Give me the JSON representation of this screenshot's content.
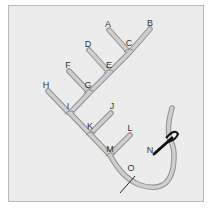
{
  "diagram": {
    "colors": {
      "background": "#ececec",
      "frame_border": "#b8b8b8",
      "tube_fill": "#cfcfcf",
      "tube_outline": "#8f8f8f",
      "needle": "#111111",
      "label": "#333333"
    },
    "labels": [
      {
        "id": "A",
        "text": "A",
        "x": 108,
        "y": 27
      },
      {
        "id": "B",
        "text": "B",
        "x": 150,
        "y": 26
      },
      {
        "id": "C",
        "text": "C",
        "x": 129,
        "y": 46
      },
      {
        "id": "D",
        "text": "D",
        "x": 88,
        "y": 47
      },
      {
        "id": "E",
        "text": "E",
        "x": 109,
        "y": 68
      },
      {
        "id": "F",
        "text": "F",
        "x": 68,
        "y": 68
      },
      {
        "id": "G",
        "text": "G",
        "x": 88,
        "y": 88
      },
      {
        "id": "H",
        "text": "H",
        "x": 46,
        "y": 88
      },
      {
        "id": "I",
        "text": "I",
        "x": 68,
        "y": 109
      },
      {
        "id": "J",
        "text": "J",
        "x": 112,
        "y": 109
      },
      {
        "id": "K",
        "text": "K",
        "x": 90,
        "y": 129
      },
      {
        "id": "L",
        "text": "L",
        "x": 130,
        "y": 131
      },
      {
        "id": "M",
        "text": "M",
        "x": 110,
        "y": 152
      },
      {
        "id": "N",
        "text": "N",
        "x": 150,
        "y": 153
      },
      {
        "id": "O",
        "text": "O",
        "x": 131,
        "y": 171
      }
    ]
  }
}
